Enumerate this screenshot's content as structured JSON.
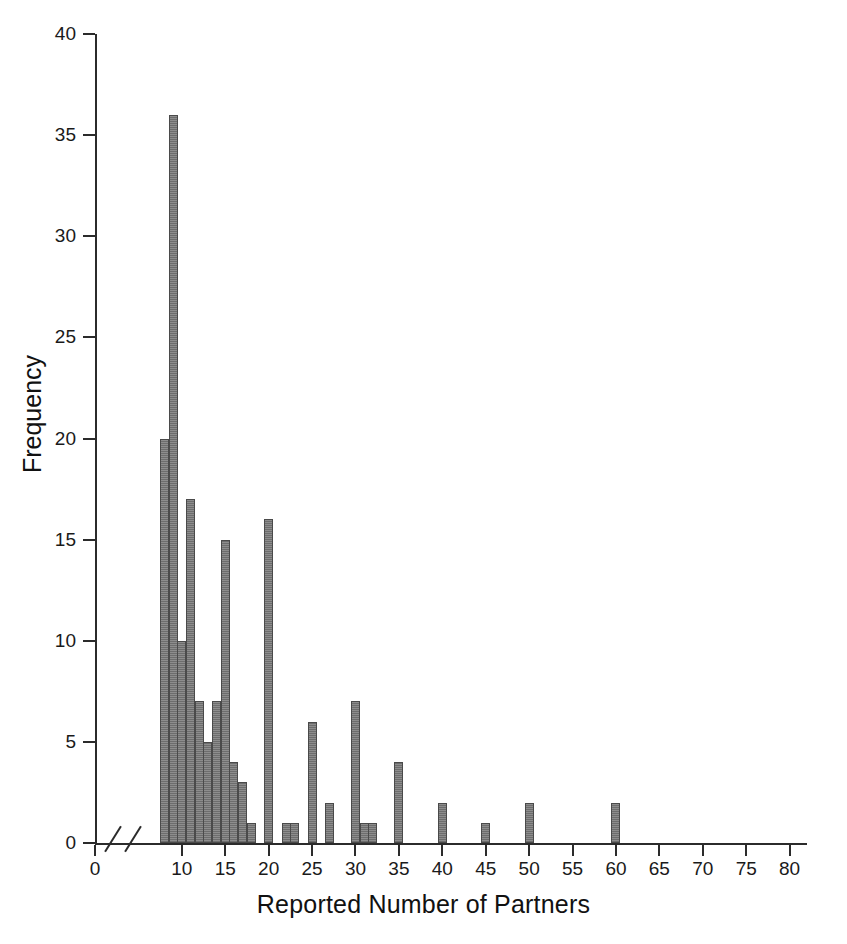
{
  "chart_data": {
    "type": "bar",
    "title": "",
    "xlabel": "Reported Number of Partners",
    "ylabel": "Frequency",
    "xlim": [
      0,
      82
    ],
    "ylim": [
      0,
      40
    ],
    "xticks": [
      0,
      10,
      15,
      20,
      25,
      30,
      35,
      40,
      45,
      50,
      55,
      60,
      65,
      70,
      75,
      80
    ],
    "yticks": [
      0,
      5,
      10,
      15,
      20,
      25,
      30,
      35,
      40
    ],
    "grid": false,
    "legend": null,
    "axis_break_x": true,
    "bar_color": "#7a7a7a",
    "categories": [
      8,
      9,
      10,
      11,
      12,
      13,
      14,
      15,
      16,
      17,
      18,
      20,
      22,
      23,
      25,
      27,
      30,
      31,
      32,
      35,
      40,
      45,
      50,
      60
    ],
    "values": [
      20,
      36,
      10,
      17,
      7,
      5,
      7,
      15,
      4,
      3,
      1,
      16,
      1,
      1,
      6,
      2,
      7,
      1,
      1,
      4,
      2,
      1,
      2,
      2
    ]
  },
  "axes": {
    "y_label": "Frequency",
    "x_label": "Reported Number of Partners"
  }
}
